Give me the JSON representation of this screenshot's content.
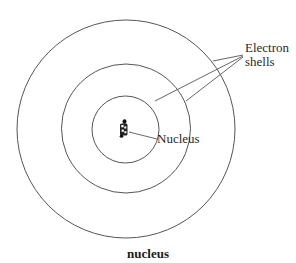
{
  "diagram": {
    "stroke_color": "#555555",
    "center": {
      "x": 126,
      "y": 129
    },
    "shells": [
      {
        "name": "inner-shell",
        "radius": 34
      },
      {
        "name": "middle-shell",
        "radius": 65
      },
      {
        "name": "outer-shell",
        "radius": 109
      }
    ],
    "labels": {
      "electron_line1": "Electron",
      "electron_line2": "shells",
      "nucleus": "Nucleus"
    },
    "caption": "nucleus"
  }
}
